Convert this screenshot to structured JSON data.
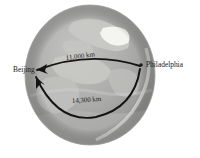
{
  "figure": {
    "name": "globe-great-circle-distance-diagram",
    "background_color": "#ffffff"
  },
  "globe": {
    "name": "earth-globe",
    "center_x": 90,
    "center_y": 75,
    "radius_x": 65,
    "radius_y": 70,
    "ocean_color": "#a8a8a8",
    "land_color": "#c6c6c4",
    "ice_color": "#f2f2ef",
    "shadow_color": "#8e8e8e",
    "outline_color": "#9a9a9a"
  },
  "cities": [
    {
      "id": "beijing",
      "label": "Beijing",
      "marker_x": 33,
      "marker_y": 70,
      "label_x": 13,
      "label_y": 72,
      "anchor": "start",
      "has_dot": false
    },
    {
      "id": "philadelphia",
      "label": "Philadelphia",
      "marker_x": 141,
      "marker_y": 65,
      "label_x": 146,
      "label_y": 67,
      "anchor": "start",
      "has_dot": true
    }
  ],
  "routes": [
    {
      "id": "short-route",
      "label": "11,000 km",
      "label_x": 66,
      "label_y": 60,
      "label_rotation": -7,
      "stroke_color": "#141414",
      "stroke_width": 1.9,
      "arrow_at": "beijing"
    },
    {
      "id": "long-route",
      "label": "14,300 km",
      "label_x": 72,
      "label_y": 103,
      "label_rotation": -4,
      "stroke_color": "#141414",
      "stroke_width": 1.9,
      "arrow_at": "beijing"
    }
  ]
}
